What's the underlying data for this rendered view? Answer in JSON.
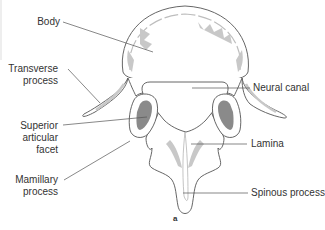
{
  "figure": {
    "panel_label": "a",
    "colors": {
      "outline": "#555555",
      "shading": "#c8c8c8",
      "facet_fill": "#8a8a8a",
      "leader_line": "#555555",
      "text": "#333333"
    }
  },
  "labels": {
    "body": "Body",
    "transverse_process": [
      "Transverse",
      "process"
    ],
    "superior_articular_facet": [
      "Superior",
      "articular",
      "facet"
    ],
    "mamillary_process": [
      "Mamillary",
      "process"
    ],
    "neural_canal": "Neural canal",
    "lamina": "Lamina",
    "spinous_process": "Spinous process"
  }
}
